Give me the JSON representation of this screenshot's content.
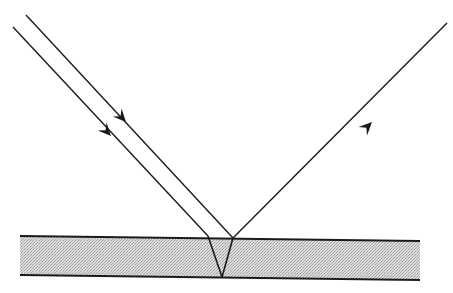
{
  "diagram": {
    "type": "thin-film-reflection",
    "colors": {
      "line": "#1a1a1a",
      "slab_fill": "#d4d4d4",
      "slab_dot": "#a8a8a8",
      "background": "#ffffff"
    },
    "slab": {
      "top_left": [
        20,
        236
      ],
      "top_right": [
        420,
        241
      ],
      "bottom_left": [
        20,
        275
      ],
      "bottom_right": [
        420,
        280
      ]
    },
    "rays": {
      "incident_outer": {
        "from": [
          26,
          15
        ],
        "to": [
          233,
          238
        ],
        "arrow_at": [
          120,
          116
        ]
      },
      "incident_inner": {
        "from": [
          13,
          27
        ],
        "to": [
          208,
          236
        ],
        "arrow_at": [
          105,
          130
        ]
      },
      "refracted_down": {
        "from": [
          208,
          236
        ],
        "to": [
          222,
          277
        ]
      },
      "refracted_up": {
        "from": [
          222,
          277
        ],
        "to": [
          233,
          238
        ]
      },
      "reflected": {
        "from": [
          233,
          238
        ],
        "to": [
          447,
          23
        ],
        "arrow_at": [
          366,
          128
        ]
      }
    }
  }
}
